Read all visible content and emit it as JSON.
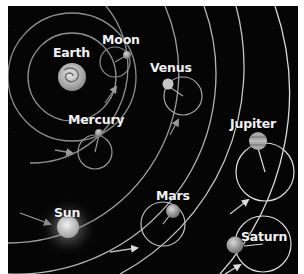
{
  "diagram": {
    "type": "geocentric-model",
    "center_body": "Earth",
    "bodies": [
      {
        "id": "earth",
        "label": "Earth",
        "x": 72,
        "y": 77,
        "r": 14,
        "color": "#c8c8c8"
      },
      {
        "id": "moon",
        "label": "Moon",
        "x": 127,
        "y": 55,
        "r": 4,
        "color": "#bdbdbd"
      },
      {
        "id": "mercury",
        "label": "Mercury",
        "x": 99,
        "y": 133,
        "r": 4,
        "color": "#9a9a9a"
      },
      {
        "id": "venus",
        "label": "Venus",
        "x": 168,
        "y": 84,
        "r": 5.5,
        "color": "#c0c0c0"
      },
      {
        "id": "sun",
        "label": "Sun",
        "x": 68,
        "y": 227,
        "r": 11,
        "color": "#d8d8d8"
      },
      {
        "id": "mars",
        "label": "Mars",
        "x": 173,
        "y": 211,
        "r": 7,
        "color": "#8a8a8a"
      },
      {
        "id": "jupiter",
        "label": "Jupiter",
        "x": 258,
        "y": 141,
        "r": 9,
        "color": "#a8a8a8"
      },
      {
        "id": "saturn",
        "label": "Saturn",
        "x": 235,
        "y": 245,
        "r": 8.5,
        "color": "#b0b0b0"
      }
    ],
    "labels": {
      "earth": "Earth",
      "moon": "Moon",
      "venus": "Venus",
      "mercury": "Mercury",
      "jupiter": "Jupiter",
      "sun": "Sun",
      "mars": "Mars",
      "saturn": "Saturn"
    },
    "colors": {
      "background": "#050505",
      "orbit_line": "#9a9a9a",
      "outer_orbit_line": "#d8d8d8",
      "label_text": "#f2f2f2"
    }
  }
}
